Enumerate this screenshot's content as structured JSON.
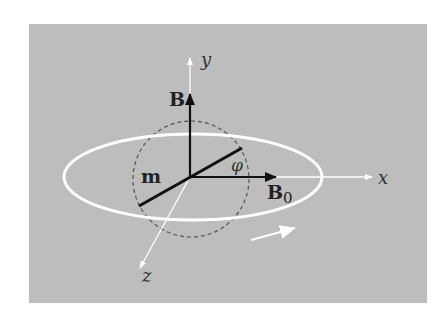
{
  "diagram": {
    "colors": {
      "panel": "#bdbdbd",
      "ring": "#ffffff",
      "axes": "#ffffff",
      "vectors": "#111111",
      "dashed": "#555555",
      "text": "#222222"
    },
    "axis_labels": {
      "x": "x",
      "y": "y",
      "z": "z"
    },
    "vector_labels": {
      "B": "B",
      "B0": "B",
      "B0_sub": "0",
      "m": "m"
    },
    "angle_label": "φ",
    "rotation_arrow": "rotation-direction"
  }
}
